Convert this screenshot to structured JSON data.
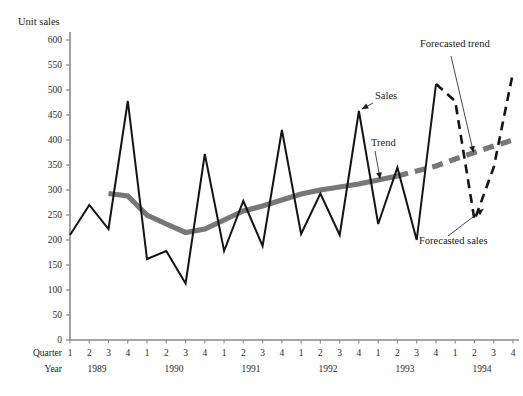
{
  "axis": {
    "y_title": "Unit sales",
    "y_ticks": [
      "600",
      "550",
      "500",
      "450",
      "400",
      "350",
      "300",
      "250",
      "200",
      "150",
      "100",
      "50",
      "0"
    ],
    "quarter_row_header": "Quarter",
    "year_row_header": "Year",
    "quarter_labels": [
      "1",
      "2",
      "3",
      "4",
      "1",
      "2",
      "3",
      "4",
      "1",
      "2",
      "3",
      "4",
      "1",
      "2",
      "3",
      "4",
      "1",
      "2",
      "3",
      "4",
      "1",
      "2",
      "3",
      "4"
    ],
    "year_labels": [
      "1989",
      "1990",
      "1991",
      "1992",
      "1993",
      "1994"
    ]
  },
  "annotations": {
    "sales": "Sales",
    "trend": "Trend",
    "forecasted_trend": "Forecasted trend",
    "forecasted_sales": "Forecasted sales"
  },
  "colors": {
    "sales_line": "#141414",
    "trend_line": "#777777",
    "axis": "#8a8a8a",
    "text": "#1a1a1a",
    "background": "#ffffff"
  },
  "chart_data": {
    "type": "line",
    "title": "",
    "xlabel": "",
    "ylabel": "Unit sales",
    "ylim": [
      0,
      600
    ],
    "ytick_step": 50,
    "grid": false,
    "legend": "inline-annotations",
    "categories": [
      "1989 Q1",
      "1989 Q2",
      "1989 Q3",
      "1989 Q4",
      "1990 Q1",
      "1990 Q2",
      "1990 Q3",
      "1990 Q4",
      "1991 Q1",
      "1991 Q2",
      "1991 Q3",
      "1991 Q4",
      "1992 Q1",
      "1992 Q2",
      "1992 Q3",
      "1992 Q4",
      "1993 Q1",
      "1993 Q2",
      "1993 Q3",
      "1993 Q4",
      "1994 Q1",
      "1994 Q2",
      "1994 Q3",
      "1994 Q4"
    ],
    "series": [
      {
        "name": "Sales",
        "style": "solid",
        "color": "#141414",
        "values": [
          210,
          270,
          222,
          478,
          162,
          178,
          113,
          372,
          178,
          278,
          188,
          420,
          212,
          293,
          210,
          458,
          232,
          345,
          200,
          512,
          null,
          null,
          null,
          null
        ]
      },
      {
        "name": "Forecasted sales",
        "style": "dashed",
        "color": "#141414",
        "values": [
          null,
          null,
          null,
          null,
          null,
          null,
          null,
          null,
          null,
          null,
          null,
          null,
          null,
          null,
          null,
          null,
          null,
          null,
          null,
          512,
          478,
          240,
          345,
          535
        ]
      },
      {
        "name": "Trend",
        "style": "solid-thick",
        "color": "#777777",
        "values": [
          null,
          null,
          293,
          288,
          250,
          232,
          215,
          222,
          240,
          258,
          268,
          280,
          292,
          300,
          306,
          312,
          320,
          328,
          null,
          null,
          null,
          null,
          null,
          null
        ]
      },
      {
        "name": "Forecasted trend",
        "style": "dashed-thick",
        "color": "#777777",
        "values": [
          null,
          null,
          null,
          null,
          null,
          null,
          null,
          null,
          null,
          null,
          null,
          null,
          null,
          null,
          null,
          null,
          null,
          328,
          338,
          348,
          362,
          375,
          388,
          400
        ]
      }
    ]
  }
}
